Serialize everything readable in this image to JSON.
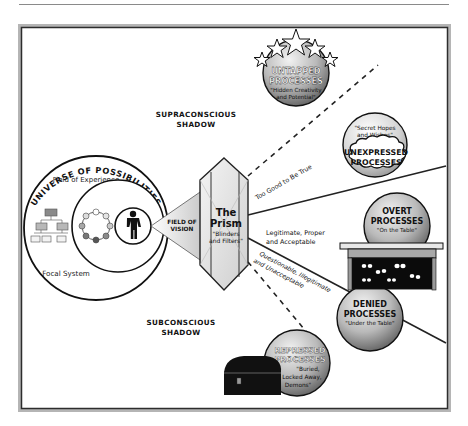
{
  "diagram": {
    "universe": {
      "title": "UNIVERSE OF POSSIBILITIES",
      "field_of_experience": "Field of Experience",
      "focal_system": "Focal System"
    },
    "field_of_vision": {
      "line1": "FIELD OF",
      "line2": "VISION"
    },
    "prism": {
      "title_line1": "The",
      "title_line2": "Prism",
      "sub_line1": "\"Blinders",
      "sub_line2": "and Filters\""
    },
    "supraconscious": {
      "line1": "SUPRACONSCIOUS",
      "line2": "SHADOW"
    },
    "subconscious": {
      "line1": "SUBCONSCIOUS",
      "line2": "SHADOW"
    },
    "rays": {
      "too_good": "Too Good to Be True",
      "legit_line1": "Legitimate, Proper",
      "legit_line2": "and Acceptable",
      "quest_line1": "Questionable, Illegitimate",
      "quest_line2": "and Unacceptable"
    },
    "untapped": {
      "line1": "UNTAPPED",
      "line2": "PROCESSES",
      "sub1": "\"Hidden Creativity",
      "sub2": "and Potential\""
    },
    "unexpressed": {
      "quote1": "\"Secret Hopes",
      "quote2": "and Wishes\"",
      "line1": "UNEXPRESSED",
      "line2": "PROCESSES"
    },
    "overt": {
      "line1": "OVERT",
      "line2": "PROCESSES",
      "sub": "\"On the Table\""
    },
    "denied": {
      "line1": "DENIED",
      "line2": "PROCESSES",
      "sub": "\"Under the Table\""
    },
    "repressed": {
      "line1": "REPRESSED",
      "line2": "PROCESSES",
      "sub1": "\"Buried,",
      "sub2": "Locked Away,",
      "sub3": "Demons\""
    },
    "colors": {
      "frame": "#3a3a3a",
      "ink": "#111111",
      "grey_light": "#d9d9d9",
      "grey_mid": "#9a9a9a",
      "grey_dark": "#555555"
    }
  }
}
